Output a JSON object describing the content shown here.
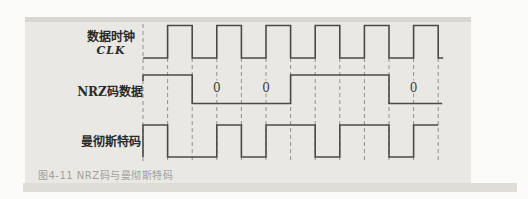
{
  "figure": {
    "caption": "图4-11 NRZ码与曼彻斯特码",
    "width": 528,
    "height": 199
  },
  "colors": {
    "panel_bg": "#e9e8e4",
    "panel_top_edge": "#d8d7d3",
    "panel_bottom_shadow": "#deddd8",
    "waveform_line": "#4a4a48",
    "dashed_line": "#90908e",
    "label_text": "#2b2b29",
    "caption_text": "#a0a09c"
  },
  "grid": {
    "x_start": 143,
    "half_step": 24.6,
    "dash_count": 13,
    "dash_top_first": 24,
    "dash_top": 58,
    "dash_bottom": 163
  },
  "signals": [
    {
      "id": "clk",
      "label": "数据时钟",
      "sublabel": "CLK",
      "y_high": 25.5,
      "y_low": 58,
      "levels": [
        0,
        1,
        0,
        1,
        0,
        1,
        0,
        1,
        0,
        1,
        0,
        1
      ],
      "tail": {
        "dx": 5,
        "level": 0
      }
    },
    {
      "id": "nrz",
      "label": "NRZ码数据",
      "sublabel": "",
      "y_high": 75,
      "y_low": 103.5,
      "levels": [
        1,
        1,
        0,
        0,
        0,
        0,
        1,
        1,
        1,
        1,
        0,
        0
      ],
      "start_tick": 6,
      "tail": {
        "dx": 4,
        "level": 0
      }
    },
    {
      "id": "manchester",
      "label": "曼彻斯特码",
      "sublabel": "",
      "y_high": 125,
      "y_low": 157,
      "levels": [
        1,
        0,
        0,
        1,
        0,
        1,
        1,
        0,
        1,
        1,
        0,
        1
      ],
      "lead_from_low": true
    }
  ],
  "nrz_bits": [
    1,
    0,
    0,
    1,
    1,
    0
  ],
  "zero_labels": {
    "text": "0",
    "dash_indices": [
      3,
      5,
      11
    ],
    "y": 92
  }
}
